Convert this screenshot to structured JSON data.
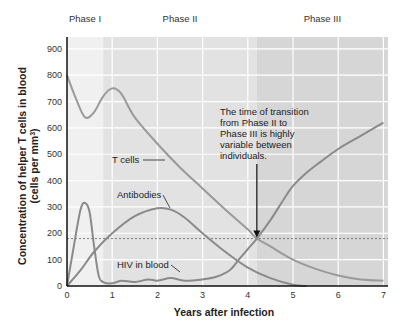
{
  "chart_data": {
    "type": "line",
    "title": "",
    "xlabel": "Years after infection",
    "ylabel": "Concentration of helper T cells in blood (cells per mm³)",
    "ylabel_line1": "Concentration of helper T cells in blood",
    "ylabel_line2": "(cells per mm",
    "ylabel_sup": "3",
    "ylabel_close": ")",
    "xlim": [
      0,
      7.2
    ],
    "ylim": [
      0,
      950
    ],
    "x_ticks": [
      "0",
      "1",
      "2",
      "3",
      "4",
      "5",
      "6",
      "7"
    ],
    "y_ticks": [
      "0",
      "100",
      "200",
      "300",
      "400",
      "500",
      "600",
      "700",
      "800",
      "900"
    ],
    "grid": true,
    "legend": "none (inline labels)",
    "phases": [
      {
        "label": "Phase I",
        "start": 0,
        "end": 0.8,
        "shade": "#f0f0f0"
      },
      {
        "label": "Phase II",
        "start": 0.8,
        "end": 4.2,
        "shade": "#e2e2e2"
      },
      {
        "label": "Phase III",
        "start": 4.2,
        "end": 7.2,
        "shade": "#d6d6d6"
      }
    ],
    "threshold_line": {
      "y": 180,
      "style": "dashed"
    },
    "series": [
      {
        "name": "T cells",
        "label": "T cells",
        "color": "#9a9a9a",
        "x": [
          0,
          0.2,
          0.4,
          0.6,
          0.8,
          1.0,
          1.2,
          1.5,
          2.0,
          2.5,
          3.0,
          3.5,
          4.0,
          4.2,
          4.5,
          5.0,
          5.5,
          6.0,
          6.5,
          7.0
        ],
        "values": [
          800,
          710,
          640,
          660,
          720,
          750,
          730,
          640,
          540,
          450,
          370,
          290,
          215,
          180,
          150,
          100,
          65,
          40,
          25,
          20
        ]
      },
      {
        "name": "Antibodies",
        "label": "Antibodies",
        "color": "#8a8a8a",
        "x": [
          0,
          0.3,
          0.6,
          1.0,
          1.5,
          2.0,
          2.3,
          2.6,
          3.0,
          3.5,
          4.0,
          4.5,
          5.0,
          5.3
        ],
        "values": [
          0,
          60,
          130,
          200,
          265,
          295,
          290,
          260,
          200,
          130,
          70,
          30,
          5,
          0
        ]
      },
      {
        "name": "HIV in blood",
        "label": "HIV in blood",
        "color": "#8a8a8a",
        "x": [
          0,
          0.15,
          0.3,
          0.4,
          0.5,
          0.6,
          0.7,
          0.8,
          1.0,
          1.2,
          1.5,
          1.8,
          2.0,
          2.3,
          2.6,
          3.0,
          3.3,
          3.6,
          3.8,
          4.0,
          4.2,
          4.5,
          4.8,
          5.0,
          5.3,
          5.6,
          6.0,
          6.5,
          7.0
        ],
        "values": [
          0,
          150,
          290,
          315,
          280,
          150,
          40,
          15,
          10,
          20,
          15,
          25,
          20,
          30,
          20,
          25,
          35,
          60,
          100,
          140,
          180,
          250,
          330,
          380,
          430,
          470,
          520,
          570,
          620
        ]
      }
    ],
    "annotations": [
      {
        "text_lines": [
          "The time of transition",
          "from Phase II to",
          "Phase III is highly",
          "variable between",
          "individuals."
        ],
        "arrow_to": {
          "x": 4.2,
          "y": 180
        }
      }
    ]
  }
}
